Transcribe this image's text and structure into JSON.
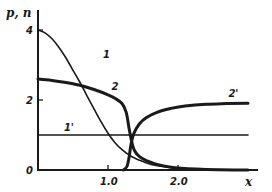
{
  "chart_data": {
    "type": "line",
    "title": "",
    "xlabel": "x",
    "ylabel": "p, n",
    "xlim": [
      0,
      3.15
    ],
    "ylim": [
      0,
      4.5
    ],
    "x_ticks": [
      {
        "value": 1.0,
        "label": "1.0"
      },
      {
        "value": 2.0,
        "label": "2.0"
      }
    ],
    "y_ticks": [
      {
        "value": 0,
        "label": "0"
      },
      {
        "value": 2,
        "label": "2"
      },
      {
        "value": 4,
        "label": "4"
      }
    ],
    "grid": false,
    "legend": "inline curve labels",
    "series": [
      {
        "name": "1",
        "style": "thin",
        "label_at": [
          0.93,
          3.2
        ],
        "points": [
          [
            0,
            4.0
          ],
          [
            0.1,
            3.92
          ],
          [
            0.2,
            3.75
          ],
          [
            0.3,
            3.5
          ],
          [
            0.4,
            3.2
          ],
          [
            0.5,
            2.85
          ],
          [
            0.6,
            2.5
          ],
          [
            0.7,
            2.12
          ],
          [
            0.8,
            1.75
          ],
          [
            0.9,
            1.38
          ],
          [
            1.0,
            1.05
          ],
          [
            1.1,
            0.78
          ],
          [
            1.2,
            0.58
          ],
          [
            1.3,
            0.43
          ],
          [
            1.4,
            0.32
          ],
          [
            1.5,
            0.24
          ],
          [
            1.6,
            0.17
          ],
          [
            1.8,
            0.09
          ],
          [
            2.0,
            0.04
          ],
          [
            2.2,
            0.02
          ],
          [
            2.5,
            0.01
          ],
          [
            3.0,
            0.0
          ]
        ]
      },
      {
        "name": "2",
        "style": "thick",
        "label_at": [
          1.05,
          2.3
        ],
        "points": [
          [
            0,
            2.6
          ],
          [
            0.2,
            2.56
          ],
          [
            0.4,
            2.5
          ],
          [
            0.6,
            2.42
          ],
          [
            0.8,
            2.3
          ],
          [
            1.0,
            2.15
          ],
          [
            1.1,
            2.05
          ],
          [
            1.2,
            1.9
          ],
          [
            1.26,
            1.65
          ],
          [
            1.3,
            1.2
          ],
          [
            1.34,
            0.8
          ],
          [
            1.38,
            0.55
          ],
          [
            1.45,
            0.38
          ],
          [
            1.55,
            0.27
          ],
          [
            1.7,
            0.16
          ],
          [
            1.9,
            0.08
          ],
          [
            2.1,
            0.04
          ],
          [
            2.4,
            0.015
          ],
          [
            2.8,
            0.0
          ],
          [
            3.0,
            0.0
          ]
        ]
      },
      {
        "name": "1'",
        "style": "thin",
        "label_at": [
          0.37,
          1.12
        ],
        "points": [
          [
            0,
            1.0
          ],
          [
            3.0,
            1.0
          ]
        ]
      },
      {
        "name": "2'",
        "style": "thick",
        "label_at": [
          2.72,
          2.08
        ],
        "points": [
          [
            1.22,
            0.0
          ],
          [
            1.27,
            0.1
          ],
          [
            1.3,
            0.35
          ],
          [
            1.33,
            0.75
          ],
          [
            1.37,
            1.05
          ],
          [
            1.45,
            1.32
          ],
          [
            1.55,
            1.5
          ],
          [
            1.7,
            1.65
          ],
          [
            1.9,
            1.76
          ],
          [
            2.1,
            1.83
          ],
          [
            2.4,
            1.88
          ],
          [
            2.7,
            1.9
          ],
          [
            3.0,
            1.91
          ]
        ]
      }
    ]
  }
}
